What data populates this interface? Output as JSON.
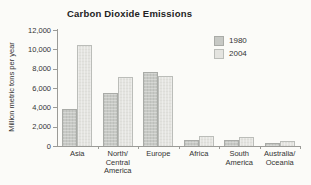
{
  "figure": {
    "background": "#fbfbf8",
    "text_color": "#333333",
    "axis_color": "#9b9b97"
  },
  "chart_data": {
    "type": "bar",
    "title": "Carbon Dioxide Emissions",
    "xlabel": "",
    "ylabel": "Million metric tons per year",
    "categories": [
      "Asia",
      "North/Central America",
      "Europe",
      "Africa",
      "South America",
      "Australia/Oceania"
    ],
    "category_lines": [
      [
        "Asia"
      ],
      [
        "North/",
        "Central",
        "America"
      ],
      [
        "Europe"
      ],
      [
        "Africa"
      ],
      [
        "South",
        "America"
      ],
      [
        "Australia/",
        "Oceania"
      ]
    ],
    "series": [
      {
        "name": "1980",
        "color": "#c7c9c5",
        "border": "#a9aba7",
        "values": [
          3800,
          5500,
          7700,
          600,
          600,
          300
        ]
      },
      {
        "name": "2004",
        "color": "#e4e4e0",
        "border": "#bbbdb9",
        "values": [
          10400,
          7100,
          7200,
          1000,
          900,
          550
        ]
      }
    ],
    "ylim": [
      0,
      12000
    ],
    "ytick_values": [
      0,
      2000,
      4000,
      6000,
      8000,
      10000,
      12000
    ],
    "ytick_labels": [
      "0",
      "2,000",
      "4,000",
      "6,000",
      "8,000",
      "10,000",
      "12,000"
    ],
    "grid": false,
    "legend_position": "top-right"
  }
}
